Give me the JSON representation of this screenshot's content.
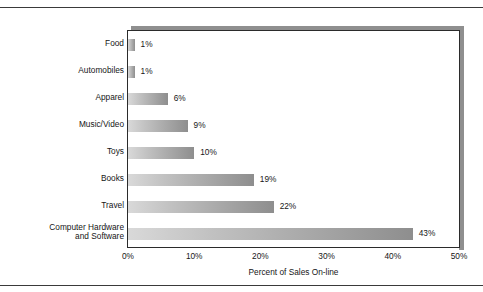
{
  "chart_data": {
    "type": "bar",
    "orientation": "horizontal",
    "title": "",
    "xlabel": "Percent of Sales On-line",
    "ylabel": "",
    "xlim": [
      0,
      50
    ],
    "xticks": [
      "0%",
      "10%",
      "20%",
      "30%",
      "40%",
      "50%"
    ],
    "xtick_values": [
      0,
      10,
      20,
      30,
      40,
      50
    ],
    "grid": false,
    "legend": null,
    "categories": [
      "Food",
      "Automobiles",
      "Apparel",
      "Music/Video",
      "Toys",
      "Books",
      "Travel",
      "Computer Hardware\nand Software"
    ],
    "values": [
      1,
      1,
      6,
      9,
      10,
      19,
      22,
      43
    ],
    "data_labels": [
      "1%",
      "1%",
      "6%",
      "9%",
      "10%",
      "19%",
      "22%",
      "43%"
    ],
    "bar_fill_light": "#d9d9d9",
    "bar_fill_dark": "#8e8e8e",
    "frame_color": "#2b2b2b",
    "shadow_color": "#8f8f8f",
    "text_color": "#161616"
  }
}
